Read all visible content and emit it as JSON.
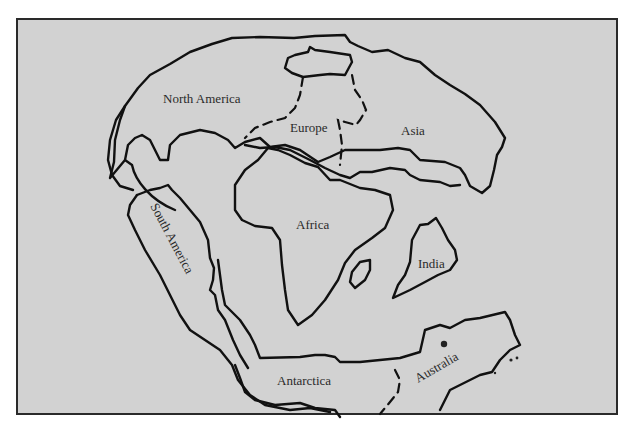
{
  "map": {
    "title": "Pangaea supercontinent reconstruction",
    "colors": {
      "background": "#d2d2d2",
      "page": "#ffffff",
      "outline": "#111111",
      "label": "#2a2a2a"
    },
    "labels": [
      {
        "id": "north-america",
        "text": "North America",
        "x": 163,
        "y": 103,
        "rotate": 0
      },
      {
        "id": "europe",
        "text": "Europe",
        "x": 290,
        "y": 132,
        "rotate": 0
      },
      {
        "id": "asia",
        "text": "Asia",
        "x": 401,
        "y": 135,
        "rotate": 0
      },
      {
        "id": "africa",
        "text": "Africa",
        "x": 296,
        "y": 229,
        "rotate": 0
      },
      {
        "id": "south-america",
        "text": "South America",
        "x": 150,
        "y": 206,
        "rotate": 62
      },
      {
        "id": "india",
        "text": "India",
        "x": 418,
        "y": 268,
        "rotate": 0
      },
      {
        "id": "antarctica",
        "text": "Antarctica",
        "x": 277,
        "y": 385,
        "rotate": 0
      },
      {
        "id": "australia",
        "text": "Australia",
        "x": 418,
        "y": 383,
        "rotate": -30
      }
    ],
    "outlines": {
      "laurasia": "M 175,210 C 150,200 135,180 132,165 L 125,160 L 110,178 L 114,162 L 115,140 L 120,120 L 125,106 L 138,88 L 150,75 L 170,64 L 190,52 L 212,44 L 232,38 L 260,37 L 294,38 L 315,36 L 345,35 L 350,42 L 358,46 L 372,52 L 388,50 L 405,58 L 420,62 L 435,75 L 450,85 L 465,94 L 480,105 L 495,122 L 505,138 L 502,147 L 497,155 L 494,170 L 490,186 L 482,193 L 470,186 L 465,175 L 460,168 L 445,162 L 420,160 L 410,150 L 398,148 L 380,150 L 360,150 L 345,150 L 330,157 L 318,162 L 300,150 L 285,145 L 270,147 L 260,138 L 245,142 L 235,148 L 228,140 L 215,133 L 200,130 L 180,135 L 170,145 L 168,160 L 160,160 L 155,150 L 150,140 L 142,135 L 135,138 L 128,145 L 125,160",
      "north_america_lobe": "M 133,190 L 120,186 L 112,175 L 108,160 L 110,140 L 116,120 L 125,106",
      "greenland": "M 288,58 L 295,55 L 308,52 L 310,47 L 315,50 L 330,52 L 350,55 L 352,62 L 345,75 L 330,74 L 320,75 L 303,77 L 292,73 L 285,68 Z",
      "europe_dash": "M 303,77 L 300,95 L 295,108 L 285,118 L 270,122 L 255,128 L 245,138",
      "ural_dash": "M 352,75 L 355,90 L 362,100 L 366,110 L 360,120 L 356,125 L 345,122 L 338,120 L 340,130 L 342,145 L 340,165",
      "asia_boundary": "M 245,145 L 260,148 L 275,147 L 290,150 L 300,155 L 310,160 L 325,168 L 340,175 L 350,178 L 360,172 L 372,172 L 390,168 L 405,170 L 410,175 L 420,180 L 440,182 L 450,186 L 460,185",
      "africa": "M 235,185 L 235,210 L 242,220 L 255,226 L 272,228 L 280,240 L 282,265 L 285,290 L 288,310 L 298,325 L 312,315 L 325,300 L 338,280 L 345,263 L 355,250 L 372,238 L 385,228 L 393,210 L 390,195 L 375,190 L 360,188 L 340,180 L 330,180 L 318,167 L 305,163 L 290,155 L 278,150 L 268,148 L 258,160 L 245,170 Z",
      "madagascar": "M 350,282 L 352,272 L 360,262 L 370,260 L 370,270 L 365,280 L 355,288 Z",
      "india": "M 393,298 L 398,285 L 405,275 L 410,262 L 412,240 L 420,225 L 428,224 L 436,218 L 442,228 L 448,240 L 455,250 L 457,260 L 450,270 L 438,275 L 425,282 L 410,290 Z",
      "south_america": "M 137,195 L 150,190 L 160,188 L 168,185 L 172,190 L 180,198 L 190,210 L 200,222 L 208,240 L 210,258 L 214,268 L 213,280 L 210,290 L 215,295 L 218,310 L 225,320 L 233,340 L 240,355 L 248,368",
      "south_america_west": "M 137,195 L 130,205 L 128,215 L 135,230 L 145,250 L 160,275 L 170,295 L 180,315 L 190,330 L 205,340 L 220,350 L 232,365 L 238,380 L 250,395 L 265,405 L 290,410 L 310,408 L 330,412",
      "africa_south_coast": "M 218,260 L 222,290 L 225,305 L 240,320 L 250,335 L 255,345 L 260,358 L 300,357 L 315,355 L 325,355 L 335,357 L 340,362 L 360,362 L 380,360 L 400,358 L 420,352 L 425,330 L 440,325 L 450,328 L 465,320 L 480,318 L 505,312 L 510,320 L 515,335 L 520,345 L 510,350 L 500,360 L 492,372 L 480,375 L 470,380 L 450,390 L 440,410",
      "australia_dash": "M 395,370 L 400,380 L 398,392 L 390,402 L 380,414",
      "antarctica_bottom": "M 235,365 L 240,378 L 245,392 L 255,400 L 275,405 L 300,403 L 315,408 L 335,410 L 340,417"
    },
    "specks": [
      {
        "x": 444,
        "y": 344,
        "r": 3.2
      },
      {
        "x": 511,
        "y": 360,
        "r": 1.6
      },
      {
        "x": 517,
        "y": 358,
        "r": 1.4
      },
      {
        "x": 495,
        "y": 373,
        "r": 1.2
      }
    ],
    "frame": {
      "x": 17,
      "y": 19,
      "width": 600,
      "height": 395
    }
  }
}
